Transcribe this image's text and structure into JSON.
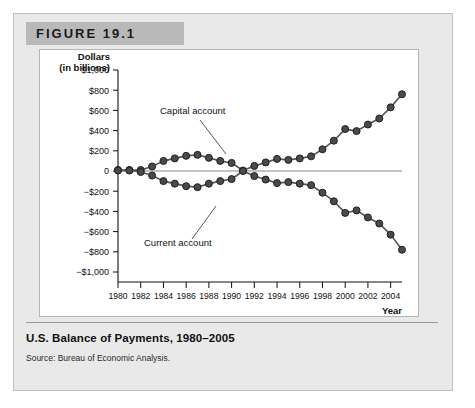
{
  "figure": {
    "header_label": "FIGURE 19.1",
    "caption_title": "U.S. Balance of Payments, 1980–2005",
    "caption_source": "Source: Bureau of Economic Analysis."
  },
  "colors": {
    "header_bar": "#b9b9b9",
    "figure_background": "#e9e9e9",
    "plot_background": "#ffffff",
    "marker_fill": "#4a4a4a",
    "marker_stroke": "#1f1f1f",
    "line": "#555555",
    "axis": "#111111",
    "zero_line": "#888888"
  },
  "chart_data": {
    "type": "line",
    "title": "U.S. Balance of Payments, 1980–2005",
    "xlabel": "Year",
    "ylabel": "Dollars (in billions)",
    "ylabel_line1": "Dollars",
    "ylabel_line2": "(in billions)",
    "xlim": [
      1980,
      2005
    ],
    "ylim": [
      -1000,
      1000
    ],
    "grid": false,
    "legend_position": "inline-annotations",
    "ytick_labels": [
      "$1,000",
      "$800",
      "$600",
      "$400",
      "$200",
      "0",
      "−$200",
      "−$400",
      "−$600",
      "−$800",
      "−$1,000"
    ],
    "ytick_values": [
      1000,
      800,
      600,
      400,
      200,
      0,
      -200,
      -400,
      -600,
      -800,
      -1000
    ],
    "xtick_labels": [
      "1980",
      "1982",
      "1984",
      "1986",
      "1988",
      "1990",
      "1992",
      "1994",
      "1996",
      "1998",
      "2000",
      "2002",
      "2004"
    ],
    "xtick_values": [
      1980,
      1982,
      1984,
      1986,
      1988,
      1990,
      1992,
      1994,
      1996,
      1998,
      2000,
      2002,
      2004
    ],
    "x": [
      1980,
      1981,
      1982,
      1983,
      1984,
      1985,
      1986,
      1987,
      1988,
      1989,
      1990,
      1991,
      1992,
      1993,
      1994,
      1995,
      1996,
      1997,
      1998,
      1999,
      2000,
      2001,
      2002,
      2003,
      2004,
      2005
    ],
    "annotations": [
      {
        "text": "Capital account",
        "series": "Capital account",
        "points_to_year": 1985
      },
      {
        "text": "Current account",
        "series": "Current account",
        "points_to_year": 1986
      }
    ],
    "series": [
      {
        "name": "Capital account",
        "values": [
          10,
          10,
          10,
          45,
          100,
          125,
          150,
          160,
          130,
          100,
          80,
          5,
          50,
          85,
          120,
          110,
          125,
          145,
          215,
          300,
          415,
          395,
          460,
          520,
          630,
          760
        ]
      },
      {
        "name": "Current account",
        "values": [
          5,
          5,
          -10,
          -45,
          -100,
          -125,
          -150,
          -160,
          -125,
          -100,
          -80,
          0,
          -50,
          -85,
          -120,
          -110,
          -125,
          -140,
          -215,
          -300,
          -415,
          -390,
          -460,
          -520,
          -630,
          -780
        ]
      }
    ]
  }
}
